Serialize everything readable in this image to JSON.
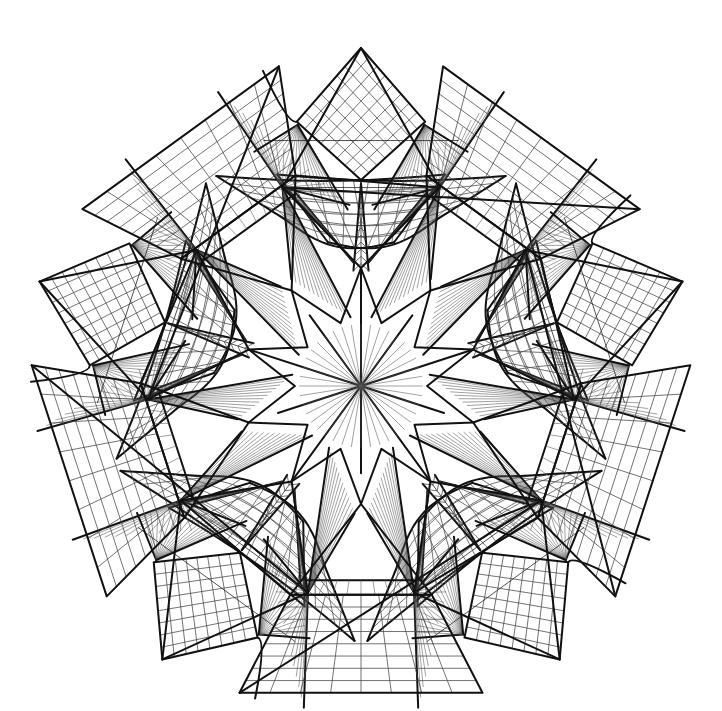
{
  "meta": {
    "kind": "line-drawing",
    "canvas": {
      "width": 722,
      "height": 711
    },
    "background_color": "#ffffff",
    "ink_color": "#111111",
    "light_ink_color": "#555555"
  },
  "geometry": {
    "center": {
      "x": 361,
      "y": 386
    },
    "symmetry_order": 5,
    "base_rotation_deg": -90,
    "outer_apex_radius": 338,
    "outer_corner_radius": 330,
    "corner_inner_radius": 232,
    "hub_radius": 118,
    "valley_radius": 250,
    "apex_diamond_half": 66,
    "corner_quad_grid": {
      "rows": 8,
      "cols": 8
    },
    "apex_diamond_grid": {
      "rows": 8,
      "cols": 8
    },
    "sail_grid": {
      "rows": 6,
      "cols": 9
    },
    "fan_ray_count": 16,
    "ladder_rung_count": 26,
    "spire_rung_count": 12,
    "center_star_points": 10
  },
  "strokes": {
    "heavy_width": 2.0,
    "mid_width": 1.25,
    "light_width": 0.75,
    "hair_width": 0.55
  },
  "legend": {
    "structure_label": "Pentagonal crease pattern",
    "elements": [
      "central star hub",
      "corner grid quads",
      "apex diamond grids",
      "curved sail grids",
      "radial fans",
      "ladder bands",
      "tapered spires"
    ]
  }
}
